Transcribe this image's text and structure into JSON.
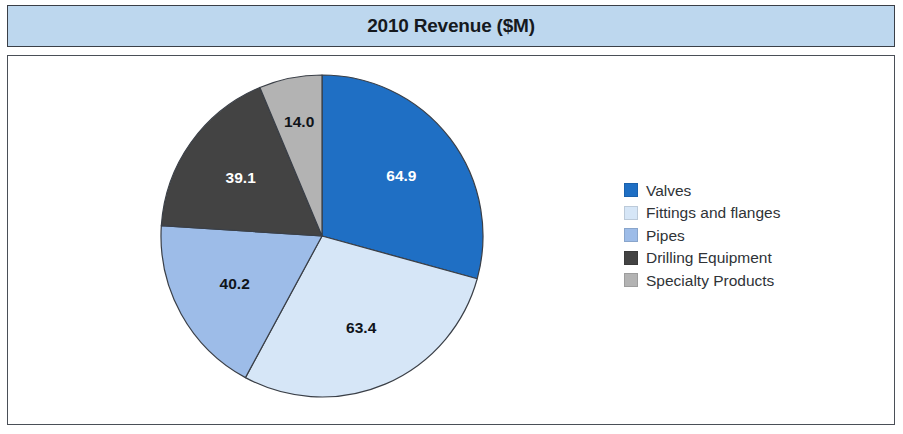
{
  "header": {
    "title": "2010 Revenue ($M)",
    "band_color": "#bdd7ee",
    "title_color": "#15191e"
  },
  "legend": {
    "position": "right",
    "items": [
      {
        "label": "Valves",
        "color": "#1f6fc4",
        "swatch": "valves-swatch"
      },
      {
        "label": "Fittings and flanges",
        "color": "#d6e6f7",
        "swatch": "fittings-and-flanges-swatch"
      },
      {
        "label": "Pipes",
        "color": "#9dbce8",
        "swatch": "pipes-swatch"
      },
      {
        "label": "Drilling Equipment",
        "color": "#434343",
        "swatch": "drilling-equipment-swatch"
      },
      {
        "label": "Specialty Products",
        "color": "#b3b3b3",
        "swatch": "specialty-products-swatch"
      }
    ]
  },
  "chart_data": {
    "type": "pie",
    "title": "2010 Revenue ($M)",
    "xlabel": "",
    "ylabel": "",
    "unit": "$M",
    "total": 221.6,
    "start_angle_deg": 0,
    "direction": "clockwise",
    "legend_position": "right",
    "grid": false,
    "categories": [
      "Valves",
      "Fittings and flanges",
      "Pipes",
      "Drilling Equipment",
      "Specialty Products"
    ],
    "values": [
      64.9,
      63.4,
      40.2,
      39.1,
      14.0
    ],
    "data_labels": [
      "64.9",
      "63.4",
      "40.2",
      "39.1",
      "14.0"
    ],
    "colors": [
      "#1f6fc4",
      "#d6e6f7",
      "#9dbce8",
      "#434343",
      "#b3b3b3"
    ],
    "label_colors": [
      "#ffffff",
      "#10141a",
      "#10141a",
      "#ffffff",
      "#10141a"
    ],
    "percentages": [
      29.3,
      28.6,
      18.1,
      17.6,
      6.3
    ],
    "slices": [
      {
        "name": "Valves",
        "value": 64.9,
        "label": "64.9",
        "color": "#1f6fc4",
        "label_color": "#ffffff",
        "percent": 29.3,
        "start_deg": 0.0,
        "end_deg": 105.4
      },
      {
        "name": "Fittings and flanges",
        "value": 63.4,
        "label": "63.4",
        "color": "#d6e6f7",
        "label_color": "#10141a",
        "percent": 28.6,
        "start_deg": 105.4,
        "end_deg": 208.4
      },
      {
        "name": "Pipes",
        "value": 40.2,
        "label": "40.2",
        "color": "#9dbce8",
        "label_color": "#10141a",
        "percent": 18.1,
        "start_deg": 208.4,
        "end_deg": 273.7
      },
      {
        "name": "Drilling Equipment",
        "value": 39.1,
        "label": "39.1",
        "color": "#434343",
        "label_color": "#ffffff",
        "percent": 17.6,
        "start_deg": 273.7,
        "end_deg": 337.3
      },
      {
        "name": "Specialty Products",
        "value": 14.0,
        "label": "14.0",
        "color": "#b3b3b3",
        "label_color": "#10141a",
        "percent": 6.3,
        "start_deg": 337.3,
        "end_deg": 360.0
      }
    ]
  },
  "geometry": {
    "center_x": 314,
    "center_y": 180,
    "radius": 161,
    "label_radius_factor": 0.62,
    "outline_color": "#3a3f47"
  }
}
